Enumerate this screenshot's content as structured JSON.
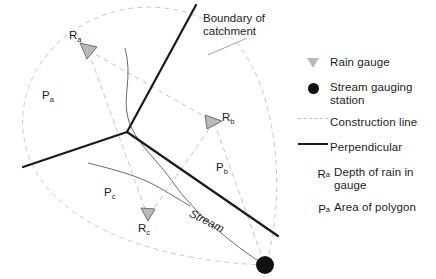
{
  "figure": {
    "background": "#ffffff"
  },
  "colors": {
    "boundary": "#c9c9c9",
    "construction": "#c4c4c4",
    "perpendicular": "#1a1a1a",
    "stream": "#6b6b6b",
    "gauge_fill": "#b9b9b9",
    "gauge_stroke": "#7a7a7a",
    "station": "#111111",
    "text": "#1d1d1d"
  },
  "annotations": {
    "boundary_line1": "Boundary of",
    "boundary_line2": "catchment",
    "stream": "Stream"
  },
  "map_labels": [
    {
      "id": "gauge-a",
      "base": "R",
      "sub": "a"
    },
    {
      "id": "gauge-b",
      "base": "R",
      "sub": "b"
    },
    {
      "id": "gauge-c",
      "base": "R",
      "sub": "c"
    },
    {
      "id": "polygon-a",
      "base": "P",
      "sub": "a"
    },
    {
      "id": "polygon-b",
      "base": "P",
      "sub": "b"
    },
    {
      "id": "polygon-c",
      "base": "P",
      "sub": "c"
    }
  ],
  "legend": {
    "items": [
      {
        "symbol": "triangle-icon",
        "label": "Rain gauge",
        "sub": ""
      },
      {
        "symbol": "circle-icon",
        "label": "Stream gauging station",
        "sub": ""
      },
      {
        "symbol": "dashed-line-icon",
        "label": "Construction line",
        "sub": ""
      },
      {
        "symbol": "solid-line-icon",
        "label": "Perpendicular",
        "sub": ""
      },
      {
        "symbol": "text-R",
        "label": "Depth of rain in gauge",
        "sub": "a"
      },
      {
        "symbol": "text-P",
        "label": "Area of polygon",
        "sub": "a"
      }
    ],
    "sym_R": "R",
    "sym_P": "P"
  },
  "geometry": {
    "junction": [
      127,
      132
    ],
    "station": [
      265,
      265
    ],
    "gauges": {
      "a": [
        88,
        50
      ],
      "b": [
        214,
        122
      ],
      "c": [
        148,
        217
      ]
    }
  }
}
